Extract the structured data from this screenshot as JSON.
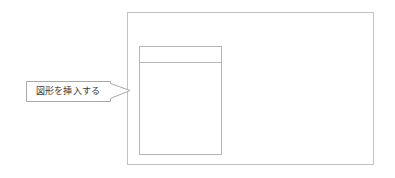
{
  "document": {
    "background_color": "#ffffff",
    "line_color": "#b8b8b8",
    "accent_line_color": "#c9c9c9",
    "text_color": "#3a3a3a"
  },
  "slide_frame": {
    "name": "slide-outer-frame",
    "x": 127,
    "y": 12,
    "width": 247,
    "height": 153,
    "border_color": "#c2c2c2"
  },
  "placeholder_shape": {
    "name": "content-placeholder",
    "x": 139,
    "y": 46,
    "width": 83,
    "height": 109,
    "border_color": "#b5b5b5",
    "header_divider_y": 62,
    "header_band_height": 16
  },
  "callout": {
    "text": "図形を挿入する",
    "box": {
      "x": 26,
      "y": 81,
      "width": 84,
      "height": 20
    },
    "tail": {
      "tip_x": 130,
      "tip_y": 90,
      "base_top_y": 83,
      "base_bottom_y": 98
    },
    "border_color": "#a8a8a8",
    "fill_color": "#ffffff",
    "text_color": "#3a3a3a"
  }
}
